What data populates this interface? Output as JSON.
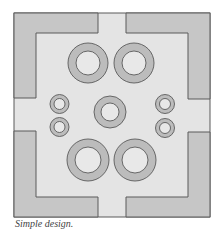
{
  "caption": "Simple design.",
  "colors": {
    "background": "#ffffff",
    "field": "#e4e4e4",
    "corner_fill": "#c6c6c6",
    "ring_fill": "#bcbcbc",
    "ring_hole": "#e8e8e8",
    "stroke": "#5a5a5a"
  },
  "frame": {
    "x": 14,
    "y": 13,
    "width": 196,
    "height": 204
  },
  "corners": [
    {
      "name": "top-left",
      "points": "14,13 98,13 98,33 36,33 36,98 14,98"
    },
    {
      "name": "top-right",
      "points": "126,13 210,13 210,99 188,99 188,33 126,33"
    },
    {
      "name": "bottom-left",
      "points": "14,131 36,131 36,197 98,197 98,217 14,217"
    },
    {
      "name": "bottom-right",
      "points": "188,132 210,132 210,217 126,217 126,197 188,197"
    }
  ],
  "rings": [
    {
      "name": "large-ring-top-left",
      "cx": 88,
      "cy": 63,
      "r": 20,
      "hole": 12
    },
    {
      "name": "large-ring-top-right",
      "cx": 134,
      "cy": 63,
      "r": 20,
      "hole": 12
    },
    {
      "name": "center-ring",
      "cx": 110,
      "cy": 112,
      "r": 16,
      "hole": 9
    },
    {
      "name": "small-ring-left-upper",
      "cx": 59.5,
      "cy": 104,
      "r": 9.5,
      "hole": 5.5
    },
    {
      "name": "small-ring-left-lower",
      "cx": 59.5,
      "cy": 127,
      "r": 9.5,
      "hole": 5.5
    },
    {
      "name": "small-ring-right-upper",
      "cx": 165,
      "cy": 104,
      "r": 9.5,
      "hole": 5.5
    },
    {
      "name": "small-ring-right-lower",
      "cx": 165,
      "cy": 128,
      "r": 9.5,
      "hole": 5.5
    },
    {
      "name": "large-ring-bottom-left",
      "cx": 88,
      "cy": 160,
      "r": 21,
      "hole": 13
    },
    {
      "name": "large-ring-bottom-right",
      "cx": 135,
      "cy": 160,
      "r": 21,
      "hole": 13
    }
  ]
}
